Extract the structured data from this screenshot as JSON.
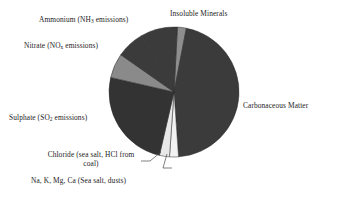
{
  "chart_data": {
    "type": "pie",
    "title": "",
    "subtitle": "",
    "xlabel": "",
    "ylabel": "",
    "legend_position": "none",
    "grid": false,
    "labels_outside": true,
    "categories": [
      "Insoluble Minerals",
      "Carbonaceous Matter",
      "Na, K, Mg, Ca (Sea salt, dusts)",
      "Chloride (sea salt, HCl from coal)",
      "Sulphate (SO2 emissions)",
      "Nitrate (NOx emissions)",
      "Ammonium (NH3 emissions)"
    ],
    "values": [
      2.2,
      45.8,
      2.2,
      2.5,
      25.0,
      6.1,
      6.9
    ],
    "units": "percent of total mass",
    "start_angle_deg": 3,
    "direction": "clockwise",
    "slice_colors": [
      "#8e8e8e",
      "#3b3b3b",
      "#f2f2f2",
      "#e8e8e8",
      "#333333",
      "#8a8a8a",
      "#3b3b3b"
    ],
    "series": [
      {
        "name": "Aerosol composition",
        "values": [
          2.2,
          45.8,
          2.2,
          2.5,
          25.0,
          6.1,
          6.9
        ]
      }
    ]
  },
  "chart": {
    "slices": [
      {
        "id": "insoluble-minerals",
        "label": "Insoluble Minerals",
        "value": 2.2,
        "color": "#8e8e8e",
        "start_deg": 3,
        "end_deg": 11
      },
      {
        "id": "carbonaceous-matter",
        "label": "Carbonaceous Matter",
        "value": 45.8,
        "color": "#3b3b3b",
        "start_deg": 11,
        "end_deg": 176
      },
      {
        "id": "na-k-mg-ca",
        "label": "Na, K, Mg, Ca (Sea salt, dusts)",
        "value": 2.2,
        "color": "#f2f2f2",
        "start_deg": 176,
        "end_deg": 184
      },
      {
        "id": "chloride",
        "label": "Chloride (sea salt, HCl from coal)",
        "value": 2.5,
        "color": "#e8e8e8",
        "start_deg": 184,
        "end_deg": 193
      },
      {
        "id": "sulphate",
        "label": "Sulphate (SO2 emissions)",
        "value": 25.0,
        "color": "#333333",
        "start_deg": 193,
        "end_deg": 283
      },
      {
        "id": "nitrate",
        "label": "Nitrate (NOx emissions)",
        "value": 6.1,
        "color": "#8a8a8a",
        "start_deg": 283,
        "end_deg": 305
      },
      {
        "id": "ammonium",
        "label": "Ammonium (NH3 emissions)",
        "value": 6.9,
        "color": "#3b3b3b",
        "start_deg": 305,
        "end_deg": 330
      },
      {
        "id": "carbonaceous-matter-upper",
        "label": "Carbonaceous Matter",
        "value": 0,
        "color": "#3b3b3b",
        "start_deg": 330,
        "end_deg": 363
      }
    ],
    "geometry": {
      "center_x": 174,
      "center_y": 92,
      "radius": 65
    }
  },
  "labels": {
    "insoluble_minerals": "Insoluble Minerals",
    "carbonaceous_matter": "Carbonaceous Matter",
    "ammonium_prefix": "Ammonium (NH",
    "ammonium_sub": "3",
    "ammonium_suffix": " emissions)",
    "nitrate_prefix": "Nitrate (NO",
    "nitrate_sub": "x",
    "nitrate_suffix": " emissions)",
    "sulphate_prefix": "Sulphate (SO",
    "sulphate_sub": "2",
    "sulphate_suffix": " emissions)",
    "chloride": "Chloride (sea salt, HCl from coal)",
    "na_k_mg_ca": "Na, K, Mg, Ca (Sea salt, dusts)"
  }
}
